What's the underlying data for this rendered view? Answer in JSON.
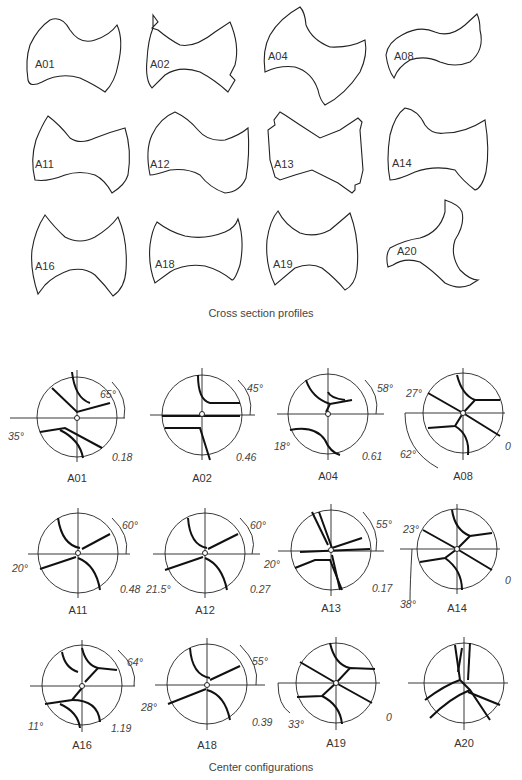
{
  "captions": {
    "top": "Cross section profiles",
    "bottom": "Center configurations"
  },
  "profiles": [
    {
      "id": "A01"
    },
    {
      "id": "A02"
    },
    {
      "id": "A04"
    },
    {
      "id": "A08"
    },
    {
      "id": "A11"
    },
    {
      "id": "A12"
    },
    {
      "id": "A13"
    },
    {
      "id": "A14"
    },
    {
      "id": "A16"
    },
    {
      "id": "A18"
    },
    {
      "id": "A19"
    },
    {
      "id": "A20"
    }
  ],
  "centers": [
    {
      "id": "A01",
      "angle_top": "65°",
      "angle_left": "35°",
      "offset": "0.18"
    },
    {
      "id": "A02",
      "angle_top": "45°",
      "offset": "0.46"
    },
    {
      "id": "A04",
      "angle_top": "58°",
      "angle_left": "18°",
      "offset": "0.61"
    },
    {
      "id": "A08",
      "angle_left": "27°",
      "angle_left2": "62°",
      "offset": "0"
    },
    {
      "id": "A11",
      "angle_top": "60°",
      "angle_left": "20°",
      "offset": "0.48"
    },
    {
      "id": "A12",
      "angle_top": "60°",
      "angle_left": "21.5°",
      "offset": "0.27"
    },
    {
      "id": "A13",
      "angle_top": "55°",
      "angle_left": "20°",
      "offset": "0.17"
    },
    {
      "id": "A14",
      "angle_left": "23°",
      "angle_left2": "38°",
      "offset": "0"
    },
    {
      "id": "A16",
      "angle_top": "64°",
      "angle_left": "11°",
      "offset": "1.19"
    },
    {
      "id": "A18",
      "angle_top": "55°",
      "angle_left": "28°",
      "offset": "0.39"
    },
    {
      "id": "A19",
      "angle_left": "33°",
      "offset": "0"
    },
    {
      "id": "A20"
    }
  ]
}
